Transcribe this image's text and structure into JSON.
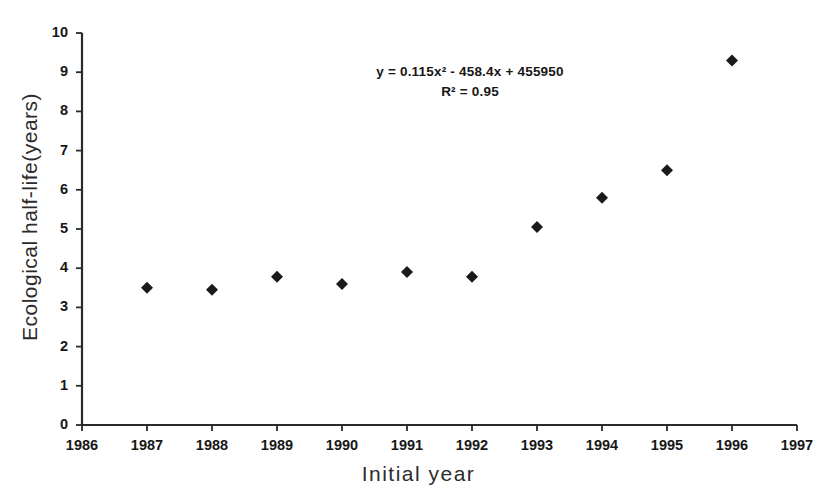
{
  "chart_data": {
    "type": "scatter",
    "title": "",
    "xlabel": "Initial year",
    "ylabel": "Ecological half-life(years)",
    "xlim": [
      1986,
      1997
    ],
    "ylim": [
      0,
      10
    ],
    "xticks": [
      1986,
      1987,
      1988,
      1989,
      1990,
      1991,
      1992,
      1993,
      1994,
      1995,
      1996,
      1997
    ],
    "yticks": [
      0,
      1,
      2,
      3,
      4,
      5,
      6,
      7,
      8,
      9,
      10
    ],
    "xtick_labels": [
      "1986",
      "1987",
      "1988",
      "1989",
      "1990",
      "1991",
      "1992",
      "1993",
      "1994",
      "1995",
      "1996",
      "1997"
    ],
    "ytick_labels": [
      "0",
      "1",
      "2",
      "3",
      "4",
      "5",
      "6",
      "7",
      "8",
      "9",
      "10"
    ],
    "grid": false,
    "legend": null,
    "marker": "diamond",
    "marker_color": "#1a1a1a",
    "line_color": "#111111",
    "x": [
      1987,
      1988,
      1989,
      1990,
      1991,
      1992,
      1993,
      1994,
      1995,
      1996
    ],
    "values": [
      3.5,
      3.45,
      3.78,
      3.6,
      3.9,
      3.78,
      5.05,
      5.8,
      6.5,
      9.3
    ],
    "series": [
      {
        "name": "Ecological half-life",
        "x": [
          1987,
          1988,
          1989,
          1990,
          1991,
          1992,
          1993,
          1994,
          1995,
          1996
        ],
        "values": [
          3.5,
          3.45,
          3.78,
          3.6,
          3.9,
          3.78,
          5.05,
          5.8,
          6.5,
          9.3
        ]
      }
    ],
    "trendline": {
      "type": "polynomial",
      "degree": 2,
      "equation": "y = 0.115x² - 458.4x + 455950",
      "r_squared_label": "R² = 0.95",
      "coefficients": [
        0.115,
        -458.4,
        455950
      ],
      "x_start": 1987,
      "x_end": 1995.9
    },
    "annotations": [
      "y = 0.115x² - 458.4x + 455950",
      "R² = 0.95"
    ]
  },
  "axes": {
    "y_title": "Ecological half-life(years)",
    "x_title": "Initial year"
  },
  "equation": {
    "line1": "y = 0.115x² - 458.4x + 455950",
    "line2": "R² = 0.95"
  },
  "colors": {
    "ink": "#161616",
    "background": "#ffffff",
    "axis": "#2a2a2a"
  }
}
